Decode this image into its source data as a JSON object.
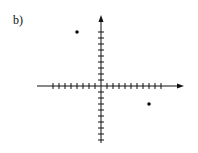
{
  "figure": {
    "label": "b)"
  },
  "chart_data": {
    "type": "scatter",
    "title": "",
    "xlabel": "",
    "ylabel": "",
    "grid": false,
    "legend": null,
    "axes": {
      "x_ticks_negative": 8,
      "x_ticks_positive": 10,
      "y_ticks_positive": 9,
      "y_ticks_negative": 9,
      "tick_labels": []
    },
    "points": [
      {
        "x": -4,
        "y": 9
      },
      {
        "x": 8,
        "y": -3
      }
    ],
    "xlim": [
      -11,
      14
    ],
    "ylim": [
      -10,
      12
    ]
  },
  "colors": {
    "ink": "#111111"
  }
}
